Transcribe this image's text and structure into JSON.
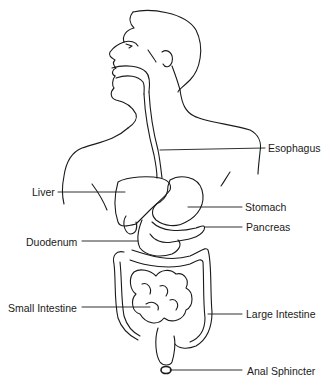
{
  "diagram": {
    "line_color": "#1a1a1a",
    "background": "#ffffff",
    "labels": [
      {
        "id": "esophagus",
        "text": "Esophagus",
        "x": 268,
        "y": 142
      },
      {
        "id": "liver",
        "text": "Liver",
        "x": 32,
        "y": 186
      },
      {
        "id": "stomach",
        "text": "Stomach",
        "x": 245,
        "y": 201
      },
      {
        "id": "pancreas",
        "text": "Pancreas",
        "x": 246,
        "y": 221
      },
      {
        "id": "duodenum",
        "text": "Duodenum",
        "x": 26,
        "y": 236
      },
      {
        "id": "small-intestine",
        "text": "Small Intestine",
        "x": 8,
        "y": 302
      },
      {
        "id": "large-intestine",
        "text": "Large Intestine",
        "x": 246,
        "y": 308
      },
      {
        "id": "anal-sphincter",
        "text": "Anal Sphincter",
        "x": 247,
        "y": 365
      }
    ]
  }
}
